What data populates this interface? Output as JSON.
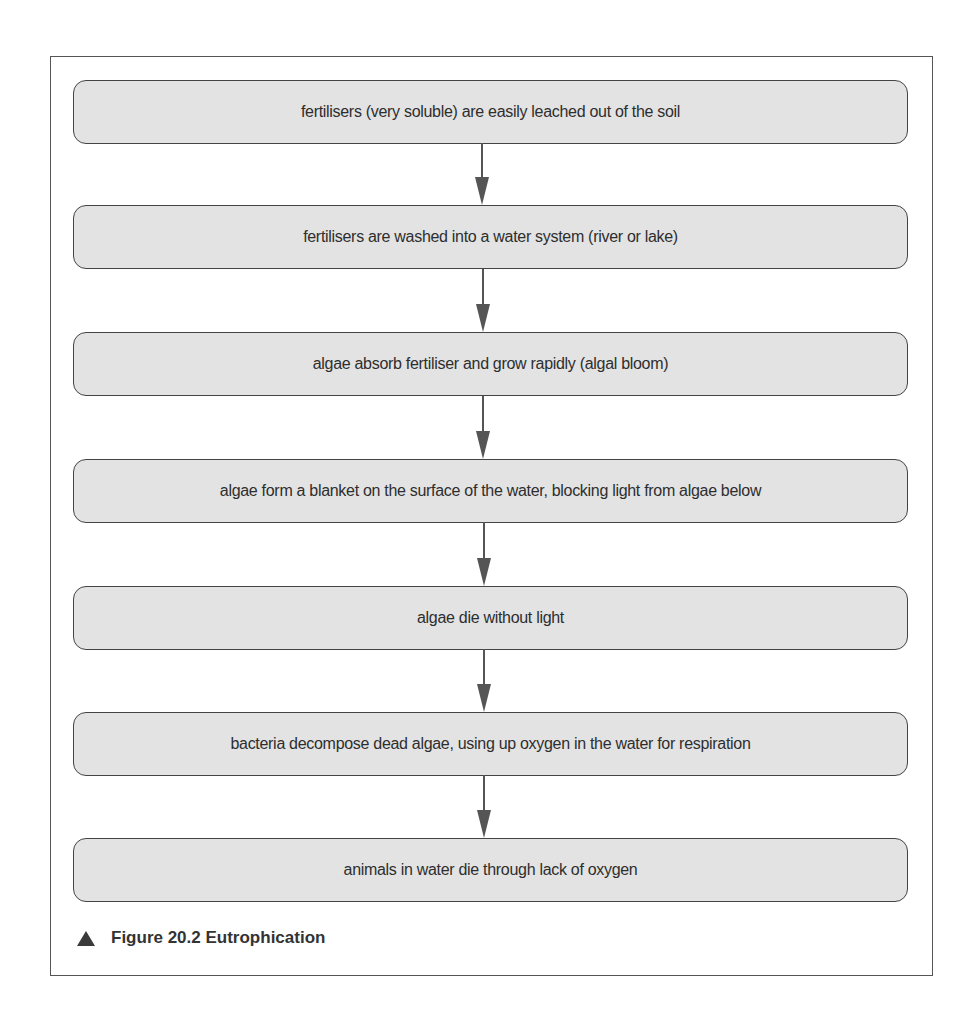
{
  "figure": {
    "caption_number": "Figure 20.2",
    "caption_title": "Eutrophication",
    "caption": "Figure 20.2 Eutrophication",
    "caption_icon": "triangle-up-icon"
  },
  "colors": {
    "box_fill": "#e3e3e3",
    "box_border": "#444444",
    "arrow": "#555555",
    "text": "#2e2e2e"
  },
  "flow": {
    "steps": [
      {
        "label": "fertilisers (very soluble) are easily leached out of the soil"
      },
      {
        "label": "fertilisers are washed into a water system (river or lake)"
      },
      {
        "label": "algae absorb fertiliser and grow rapidly (algal bloom)"
      },
      {
        "label": "algae form a blanket on the surface of the water, blocking light from algae below"
      },
      {
        "label": "algae die without light"
      },
      {
        "label": "bacteria decompose dead algae, using up oxygen in the water for respiration"
      },
      {
        "label": "animals in water die through lack of oxygen"
      }
    ],
    "connectors": [
      "1→2",
      "2→3",
      "3→4",
      "4→5",
      "5→6",
      "6→7"
    ]
  }
}
